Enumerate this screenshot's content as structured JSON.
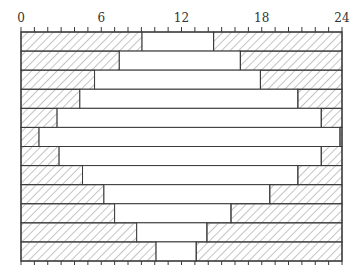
{
  "chart_data": {
    "type": "bar",
    "subtype": "horizontal-segmented",
    "title": "",
    "xlabel": "",
    "ylabel": "",
    "xlim": [
      0,
      24
    ],
    "x_ticks_major": [
      0,
      6,
      12,
      18,
      24
    ],
    "x_tick_labels": [
      "0",
      "6",
      "12",
      "18",
      "24"
    ],
    "x_tick_minor_step": 1,
    "grid": false,
    "legend": null,
    "rows": [
      {
        "row": 1,
        "start": 9.05,
        "end": 14.4
      },
      {
        "row": 2,
        "start": 7.35,
        "end": 16.4
      },
      {
        "row": 3,
        "start": 5.5,
        "end": 17.9
      },
      {
        "row": 4,
        "start": 4.4,
        "end": 20.7
      },
      {
        "row": 5,
        "start": 2.7,
        "end": 22.45
      },
      {
        "row": 6,
        "start": 1.35,
        "end": 23.85
      },
      {
        "row": 7,
        "start": 2.85,
        "end": 22.45
      },
      {
        "row": 8,
        "start": 4.6,
        "end": 20.7
      },
      {
        "row": 9,
        "start": 6.2,
        "end": 18.6
      },
      {
        "row": 10,
        "start": 7.0,
        "end": 15.7
      },
      {
        "row": 11,
        "start": 8.65,
        "end": 13.9
      },
      {
        "row": 12,
        "start": 10.1,
        "end": 13.1
      }
    ],
    "series": [
      {
        "name": "hatched-left",
        "values": [
          9.05,
          7.35,
          5.5,
          4.4,
          2.7,
          1.35,
          2.85,
          4.6,
          6.2,
          7.0,
          8.65,
          10.1
        ]
      },
      {
        "name": "white-middle",
        "values": [
          5.35,
          9.05,
          12.4,
          16.3,
          19.75,
          22.5,
          19.6,
          16.1,
          12.4,
          8.7,
          5.25,
          3.0
        ]
      },
      {
        "name": "hatched-right",
        "values": [
          9.6,
          7.6,
          6.1,
          3.3,
          1.55,
          0.15,
          1.55,
          3.3,
          5.4,
          8.3,
          10.1,
          10.9
        ]
      }
    ],
    "colors": {
      "line": "#3a3a3a",
      "hatch": "#8a8a8a",
      "fill": "#ffffff"
    }
  }
}
